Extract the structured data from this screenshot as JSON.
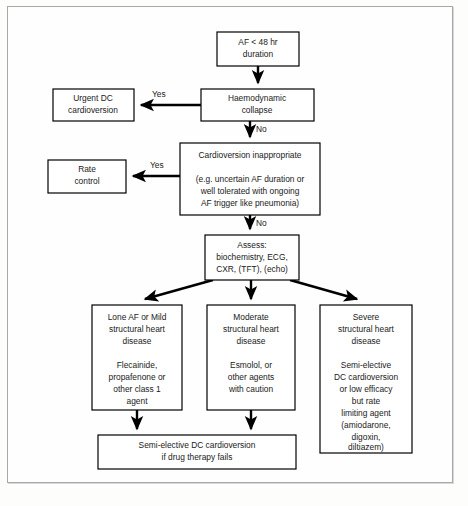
{
  "diagram": {
    "colors": {
      "page_background": "#fdfdfc",
      "frame_border": "#a8a8a8",
      "node_fill": "#ffffff",
      "node_stroke": "#000000",
      "text": "#1a1a1a",
      "edge": "#000000"
    },
    "nodes": [
      {
        "id": "start",
        "name": "af-duration-node",
        "lines": [
          "AF < 48 hr",
          "duration"
        ],
        "x": 217,
        "y": 32,
        "w": 82,
        "h": 34
      },
      {
        "id": "haemodynamic",
        "name": "haemodynamic-collapse-node",
        "lines": [
          "Haemodynamic",
          "collapse"
        ],
        "x": 201,
        "y": 89,
        "w": 113,
        "h": 32
      },
      {
        "id": "urgent_dc",
        "name": "urgent-dc-cardioversion-node",
        "lines": [
          "Urgent DC",
          "cardioversion"
        ],
        "x": 53,
        "y": 89,
        "w": 81,
        "h": 32
      },
      {
        "id": "cardioversion_inappropriate",
        "name": "cardioversion-inappropriate-node",
        "lines": [
          "Cardioversion inappropriate",
          "",
          "(e.g. uncertain AF duration or",
          "well tolerated with ongoing",
          "AF trigger like pneumonia)"
        ],
        "x": 180,
        "y": 143,
        "w": 140,
        "h": 72
      },
      {
        "id": "rate_control",
        "name": "rate-control-node",
        "lines": [
          "Rate",
          "control"
        ],
        "x": 48,
        "y": 160,
        "w": 78,
        "h": 33
      },
      {
        "id": "assess",
        "name": "assess-node",
        "lines": [
          "Assess:",
          "biochemistry, ECG,",
          "CXR, (TFT), (echo)"
        ],
        "x": 205,
        "y": 235,
        "w": 94,
        "h": 45
      },
      {
        "id": "lone_af",
        "name": "lone-af-mild-node",
        "lines": [
          "Lone AF or Mild",
          "structural heart",
          "disease",
          "",
          "Flecainide,",
          "propafenone or",
          "other class 1",
          "agent"
        ],
        "x": 92,
        "y": 305,
        "w": 90,
        "h": 105
      },
      {
        "id": "moderate",
        "name": "moderate-structural-node",
        "lines": [
          "Moderate",
          "structural heart",
          "disease",
          "",
          "Esmolol, or",
          "other agents",
          "with caution"
        ],
        "x": 207,
        "y": 305,
        "w": 88,
        "h": 105
      },
      {
        "id": "severe",
        "name": "severe-structural-node",
        "lines": [
          "Severe",
          "structural heart",
          "disease",
          "",
          "Semi-elective",
          "DC cardioversion",
          "or low efficacy",
          "but rate",
          "limiting agent",
          "(amiodarone,",
          "digoxin,",
          "diltiazem)"
        ],
        "x": 320,
        "y": 305,
        "w": 92,
        "h": 148
      },
      {
        "id": "semi_elective",
        "name": "semi-elective-dc-cardioversion-node",
        "lines": [
          "Semi-elective DC cardioversion",
          "if drug therapy fails"
        ],
        "x": 98,
        "y": 435,
        "w": 198,
        "h": 34
      }
    ],
    "edges": [
      {
        "name": "edge-start-to-haemodynamic",
        "label": ""
      },
      {
        "name": "edge-haemodynamic-to-urgent-dc",
        "label": "Yes"
      },
      {
        "name": "edge-haemodynamic-to-cardioversion",
        "label": "No"
      },
      {
        "name": "edge-cardioversion-to-rate-control",
        "label": "Yes"
      },
      {
        "name": "edge-cardioversion-to-assess",
        "label": "No"
      },
      {
        "name": "edge-assess-to-lone-af",
        "label": ""
      },
      {
        "name": "edge-assess-to-moderate",
        "label": ""
      },
      {
        "name": "edge-assess-to-severe",
        "label": ""
      },
      {
        "name": "edge-lone-af-to-semi-elective",
        "label": ""
      },
      {
        "name": "edge-moderate-to-semi-elective",
        "label": ""
      }
    ],
    "edge_labels": {
      "yes_collapse": "Yes",
      "no_collapse": "No",
      "yes_inappropriate": "Yes",
      "no_inappropriate": "No"
    }
  }
}
